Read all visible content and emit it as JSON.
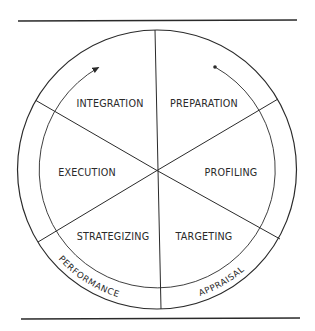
{
  "diagram": {
    "type": "cycle-wheel",
    "segments": [
      {
        "id": "integration",
        "label": "INTEGRATION",
        "x": 110,
        "y": 107
      },
      {
        "id": "preparation",
        "label": "PREPARATION",
        "x": 204,
        "y": 107
      },
      {
        "id": "profiling",
        "label": "PROFILING",
        "x": 231,
        "y": 176
      },
      {
        "id": "targeting",
        "label": "TARGETING",
        "x": 204,
        "y": 240
      },
      {
        "id": "strategizing",
        "label": "STRATEGIZING",
        "x": 113,
        "y": 240
      },
      {
        "id": "execution",
        "label": "EXECUTION",
        "x": 87,
        "y": 176
      }
    ],
    "ring_labels": [
      {
        "id": "performance",
        "label": "PERFORMANCE",
        "offset": "28"
      },
      {
        "id": "appraisal",
        "label": "APPRAISAL",
        "offset": "183"
      }
    ],
    "flow": {
      "start_marker": "dot",
      "end_marker": "arrowhead",
      "direction": "clockwise from Preparation around to Integration"
    },
    "colors": {
      "ink": "#2a2a2a",
      "background": "#ffffff"
    }
  }
}
